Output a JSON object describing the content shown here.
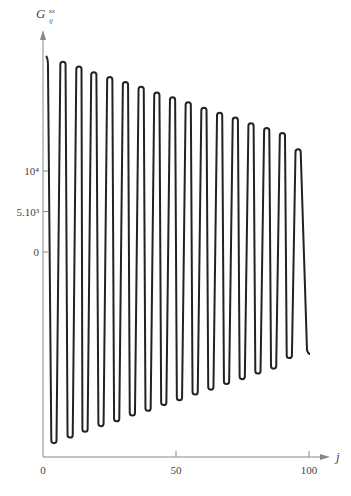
{
  "chart_data": {
    "type": "line",
    "title": "",
    "xlabel": "j",
    "ylabel": "G_ij^xx",
    "ylabel_main": "G",
    "ylabel_sup": "xx",
    "ylabel_sub": "ij",
    "xlim": [
      0,
      100
    ],
    "ylim": [
      -25000,
      25000
    ],
    "x_ticks": [
      0,
      50,
      100
    ],
    "x_tick_labels": [
      "0",
      "50",
      "100"
    ],
    "y_ticks": [
      0,
      5000,
      10000
    ],
    "y_tick_labels": [
      "0",
      "5.10³",
      "10⁴"
    ],
    "grid": false,
    "legend": null,
    "series": [
      {
        "name": "G_ij^xx",
        "x_start": 1.5,
        "x_end": 100,
        "period": 5.9,
        "amplitude_start": 23500,
        "amplitude_end": 12700,
        "peaks": [
          {
            "x": 1.5,
            "y": 24200
          },
          {
            "x": 7.5,
            "y": 23500
          },
          {
            "x": 13.5,
            "y": 22900
          },
          {
            "x": 19.1,
            "y": 22200
          },
          {
            "x": 25.1,
            "y": 21600
          },
          {
            "x": 31.0,
            "y": 21000
          },
          {
            "x": 36.9,
            "y": 20400
          },
          {
            "x": 42.8,
            "y": 19700
          },
          {
            "x": 48.7,
            "y": 19100
          },
          {
            "x": 54.6,
            "y": 18500
          },
          {
            "x": 60.5,
            "y": 17800
          },
          {
            "x": 66.4,
            "y": 17200
          },
          {
            "x": 72.3,
            "y": 16600
          },
          {
            "x": 78.2,
            "y": 15900
          },
          {
            "x": 84.1,
            "y": 15300
          },
          {
            "x": 90.0,
            "y": 14700
          },
          {
            "x": 95.9,
            "y": 12700
          }
        ],
        "troughs": [
          {
            "x": 4.1,
            "y": -23600
          },
          {
            "x": 10.2,
            "y": -22900
          },
          {
            "x": 15.8,
            "y": -22200
          },
          {
            "x": 21.8,
            "y": -21500
          },
          {
            "x": 27.7,
            "y": -20900
          },
          {
            "x": 33.6,
            "y": -20200
          },
          {
            "x": 39.5,
            "y": -19600
          },
          {
            "x": 45.4,
            "y": -18900
          },
          {
            "x": 51.3,
            "y": -18300
          },
          {
            "x": 57.2,
            "y": -17600
          },
          {
            "x": 63.1,
            "y": -17000
          },
          {
            "x": 69.0,
            "y": -16300
          },
          {
            "x": 74.9,
            "y": -15700
          },
          {
            "x": 80.8,
            "y": -15000
          },
          {
            "x": 86.7,
            "y": -14400
          },
          {
            "x": 92.6,
            "y": -13100
          }
        ],
        "end_point": {
          "x": 100,
          "y": -12600
        }
      }
    ]
  }
}
